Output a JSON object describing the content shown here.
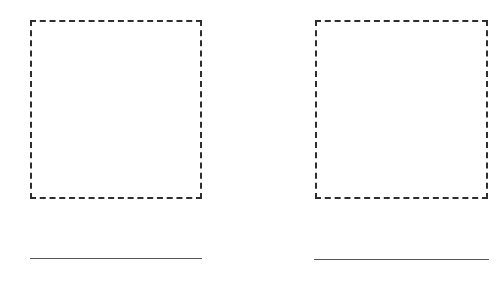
{
  "panels": [
    {
      "id": "left",
      "placeholder_box": {
        "style": "dashed",
        "content": ""
      },
      "caption": ""
    },
    {
      "id": "right",
      "placeholder_box": {
        "style": "dashed",
        "content": ""
      },
      "caption": ""
    }
  ],
  "colors": {
    "border": "#2e2e2e",
    "line": "#555555",
    "background": "#ffffff"
  }
}
